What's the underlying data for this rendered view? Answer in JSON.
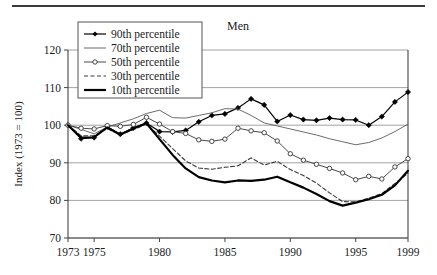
{
  "figure": {
    "title": "Men",
    "y_axis_label": "Index (1973 = 100)",
    "top_rule": "horizontal-rule"
  },
  "legend": {
    "entries": [
      {
        "label": "90th percentile",
        "style": "solid-with-filled-diamond-markers",
        "color": "#000000"
      },
      {
        "label": "70th percentile",
        "style": "thin-solid",
        "color": "#555555"
      },
      {
        "label": "50th percentile",
        "style": "solid-with-open-circle-markers",
        "color": "#444444"
      },
      {
        "label": "30th percentile",
        "style": "dashed",
        "color": "#444444"
      },
      {
        "label": "10th percentile",
        "style": "thick-solid",
        "color": "#000000"
      }
    ]
  },
  "chart_data": {
    "type": "line",
    "title": "Men",
    "xlabel": "",
    "ylabel": "Index (1973 = 100)",
    "xlim": [
      1973,
      1999
    ],
    "ylim": [
      70,
      120
    ],
    "ytick_values": [
      70,
      80,
      90,
      100,
      110,
      120
    ],
    "ytick_labels": [
      "70",
      "80",
      "90",
      "100",
      "110",
      "120"
    ],
    "xtick_values": [
      1973,
      1975,
      1980,
      1985,
      1990,
      1995,
      1999
    ],
    "xtick_labels": [
      "1973",
      "1975",
      "1980",
      "1985",
      "1990",
      "1995",
      "1999"
    ],
    "grid": "horizontal",
    "legend_position": "top-left-inside",
    "x": [
      1973,
      1974,
      1975,
      1976,
      1977,
      1978,
      1979,
      1980,
      1981,
      1982,
      1983,
      1984,
      1985,
      1986,
      1987,
      1988,
      1989,
      1990,
      1991,
      1992,
      1993,
      1994,
      1995,
      1996,
      1997,
      1998,
      1999
    ],
    "series": [
      {
        "name": "90th percentile",
        "values": [
          100.0,
          96.4,
          96.7,
          99.6,
          97.6,
          99.3,
          100.6,
          98.3,
          98.2,
          98.6,
          100.9,
          102.6,
          103.0,
          104.6,
          107.0,
          105.4,
          101.0,
          102.7,
          101.5,
          101.3,
          101.9,
          101.5,
          101.4,
          100.0,
          102.3,
          106.2,
          108.8
        ]
      },
      {
        "name": "70th percentile",
        "values": [
          100.0,
          98.9,
          97.7,
          99.5,
          100.6,
          101.7,
          103.1,
          104.0,
          102.0,
          101.9,
          102.6,
          103.3,
          104.4,
          104.3,
          102.6,
          100.6,
          99.8,
          99.0,
          98.2,
          97.4,
          96.4,
          95.6,
          94.8,
          95.4,
          96.6,
          98.3,
          100.3
        ]
      },
      {
        "name": "50th percentile",
        "values": [
          100.0,
          99.2,
          99.0,
          99.9,
          99.7,
          100.2,
          102.1,
          100.3,
          98.3,
          97.8,
          96.1,
          95.7,
          96.3,
          99.2,
          98.5,
          98.0,
          95.8,
          92.4,
          90.7,
          89.6,
          88.5,
          87.3,
          85.5,
          86.4,
          85.7,
          88.9,
          91.1
        ]
      },
      {
        "name": "30th percentile",
        "values": [
          100.0,
          97.2,
          97.2,
          99.1,
          97.4,
          98.8,
          100.3,
          97.1,
          93.8,
          90.5,
          88.6,
          88.3,
          88.8,
          89.2,
          91.3,
          89.4,
          90.4,
          88.2,
          86.6,
          84.6,
          82.0,
          79.7,
          79.6,
          80.6,
          81.8,
          84.5,
          87.2
        ]
      },
      {
        "name": "10th percentile",
        "values": [
          100.0,
          96.7,
          96.8,
          99.4,
          97.5,
          99.1,
          100.5,
          96.3,
          92.1,
          88.5,
          86.2,
          85.3,
          84.8,
          85.3,
          85.2,
          85.5,
          86.3,
          84.8,
          83.4,
          81.7,
          79.8,
          78.6,
          79.4,
          80.3,
          81.5,
          84.0,
          87.9
        ]
      }
    ]
  }
}
